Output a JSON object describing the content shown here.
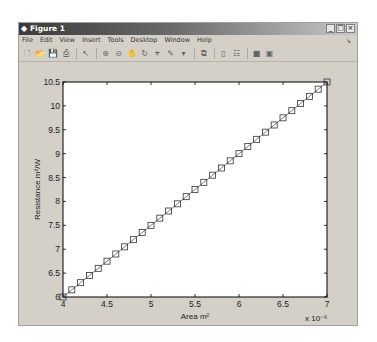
{
  "window": {
    "title": "Figure 1",
    "controls": [
      "_",
      "□",
      "×"
    ]
  },
  "menu": [
    "File",
    "Edit",
    "View",
    "Insert",
    "Tools",
    "Desktop",
    "Window",
    "Help"
  ],
  "toolbar": [
    {
      "name": "new-figure-icon",
      "glyph": "🗋"
    },
    {
      "name": "open-file-icon",
      "glyph": "📂"
    },
    {
      "name": "save-icon",
      "glyph": "💾"
    },
    {
      "name": "print-icon",
      "glyph": "⎙"
    },
    {
      "sep": true
    },
    {
      "name": "edit-plot-arrow-icon",
      "glyph": "↖"
    },
    {
      "sep": true
    },
    {
      "name": "zoom-in-icon",
      "glyph": "⊕"
    },
    {
      "name": "zoom-out-icon",
      "glyph": "⊖"
    },
    {
      "name": "pan-hand-icon",
      "glyph": "✋"
    },
    {
      "name": "rotate-3d-icon",
      "glyph": "↻"
    },
    {
      "name": "data-cursor-icon",
      "glyph": "⌖"
    },
    {
      "name": "brush-icon",
      "glyph": "✎"
    },
    {
      "name": "brush-dropdown-icon",
      "glyph": "▾"
    },
    {
      "sep": true
    },
    {
      "name": "link-plot-icon",
      "glyph": "⧉"
    },
    {
      "sep": true
    },
    {
      "name": "insert-colorbar-icon",
      "glyph": "▯"
    },
    {
      "name": "insert-legend-icon",
      "glyph": "☷"
    },
    {
      "sep": true
    },
    {
      "name": "hide-plot-tools-icon",
      "glyph": "■"
    },
    {
      "name": "show-plot-tools-icon",
      "glyph": "▣"
    }
  ],
  "chart_data": {
    "type": "line",
    "title": "",
    "xlabel": "Area m²",
    "ylabel": "Resistance m²/W",
    "x_multiplier": "x 10⁻⁶",
    "xlim": [
      4,
      7
    ],
    "ylim": [
      6,
      10.5
    ],
    "xticks": [
      4,
      4.5,
      5,
      5.5,
      6,
      6.5,
      7
    ],
    "yticks": [
      6,
      6.5,
      7,
      7.5,
      8,
      8.5,
      9,
      9.5,
      10,
      10.5
    ],
    "grid": false,
    "marker": "square",
    "series": [
      {
        "name": "Resistance",
        "x": [
          4.0,
          4.1,
          4.2,
          4.3,
          4.4,
          4.5,
          4.6,
          4.7,
          4.8,
          4.9,
          5.0,
          5.1,
          5.2,
          5.3,
          5.4,
          5.5,
          5.6,
          5.7,
          5.8,
          5.9,
          6.0,
          6.1,
          6.2,
          6.3,
          6.4,
          6.5,
          6.6,
          6.7,
          6.8,
          6.9,
          7.0
        ],
        "y": [
          6.0,
          6.15,
          6.3,
          6.45,
          6.6,
          6.75,
          6.9,
          7.05,
          7.2,
          7.35,
          7.5,
          7.65,
          7.8,
          7.95,
          8.1,
          8.25,
          8.4,
          8.55,
          8.7,
          8.85,
          9.0,
          9.15,
          9.3,
          9.45,
          9.6,
          9.75,
          9.9,
          10.05,
          10.2,
          10.35,
          10.5
        ]
      }
    ]
  }
}
